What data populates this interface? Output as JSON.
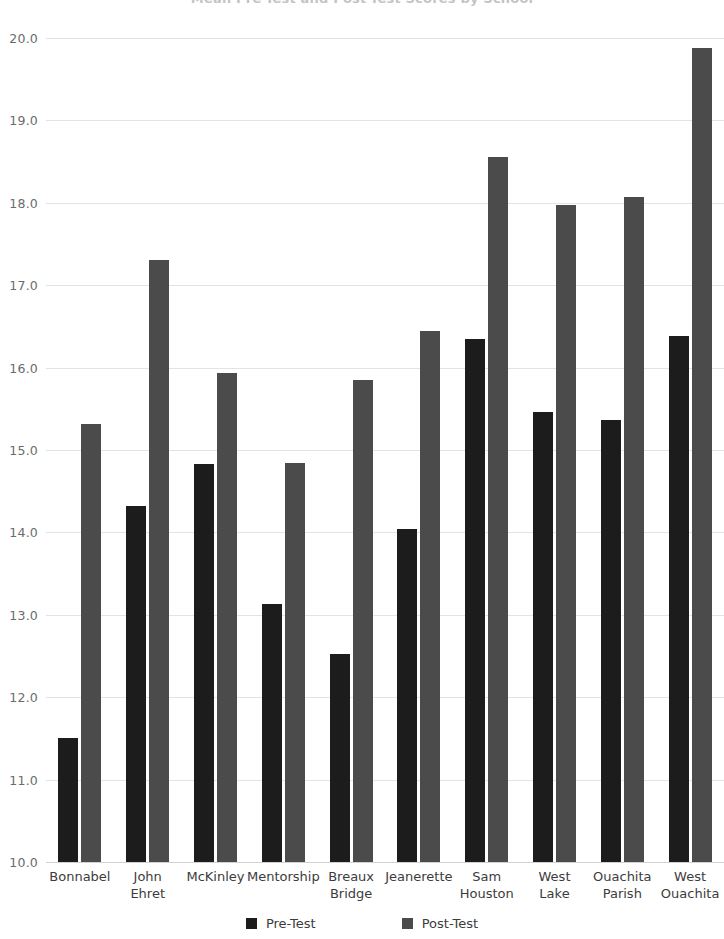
{
  "chart_data": {
    "type": "bar",
    "title": "Mean Pre-Test and Post-Test Scores by School",
    "xlabel": "",
    "ylabel": "",
    "ylim": [
      10.0,
      20.0
    ],
    "ytick_step": 1.0,
    "grid": true,
    "legend_position": "bottom",
    "categories": [
      "Bonnabel",
      "John Ehret",
      "McKinley",
      "Mentorship",
      "Breaux Bridge",
      "Jeanerette",
      "Sam Houston",
      "West Lake",
      "Ouachita Parish",
      "West Ouachita"
    ],
    "category_lines": [
      [
        "Bonnabel"
      ],
      [
        "John",
        "Ehret"
      ],
      [
        "McKinley"
      ],
      [
        "Mentorship"
      ],
      [
        "Breaux",
        "Bridge"
      ],
      [
        "Jeanerette"
      ],
      [
        "Sam",
        "Houston"
      ],
      [
        "West",
        "Lake"
      ],
      [
        "Ouachita",
        "Parish"
      ],
      [
        "West",
        "Ouachita"
      ]
    ],
    "ytick_labels": [
      "20.0",
      "19.0",
      "18.0",
      "17.0",
      "16.0",
      "15.0",
      "14.0",
      "13.0",
      "12.0",
      "11.0",
      "10.0"
    ],
    "ytick_values": [
      20.0,
      19.0,
      18.0,
      17.0,
      16.0,
      15.0,
      14.0,
      13.0,
      12.0,
      11.0,
      10.0
    ],
    "series": [
      {
        "name": "Pre-Test",
        "color": "#1c1c1c",
        "values": [
          11.5,
          14.32,
          14.83,
          13.13,
          12.52,
          14.04,
          16.35,
          15.46,
          15.36,
          16.38
        ]
      },
      {
        "name": "Post-Test",
        "color": "#4b4b4b",
        "values": [
          15.31,
          17.31,
          15.93,
          14.84,
          15.85,
          16.45,
          18.55,
          17.97,
          18.07,
          19.88
        ]
      }
    ]
  },
  "legend": {
    "items": [
      {
        "label": "Pre-Test",
        "color": "#1c1c1c"
      },
      {
        "label": "Post-Test",
        "color": "#4b4b4b"
      }
    ]
  }
}
